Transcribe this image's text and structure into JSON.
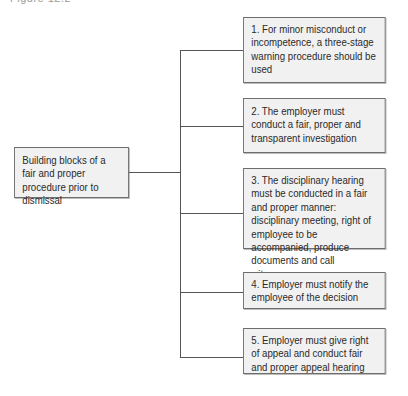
{
  "caption_fragment": "Figure 12.2",
  "root": {
    "label": "Building blocks of a fair and proper procedure prior to dismissal"
  },
  "steps": [
    {
      "label": "1. For minor misconduct or incompetence, a three-stage warning procedure should be used"
    },
    {
      "label": "2. The employer must conduct a fair, proper and transparent investigation"
    },
    {
      "label": "3. The disciplinary hearing must be conducted in a fair and proper manner: disciplinary meeting, right of employee to be accompanied, produce documents and call witnesses"
    },
    {
      "label": "4. Employer must notify the employee of the decision"
    },
    {
      "label": "5. Employer must give right of appeal and conduct fair and proper appeal hearing"
    }
  ],
  "colors": {
    "box_fill": "#f1f1f1",
    "box_border": "#6e6e6e",
    "connector": "#555555",
    "text": "#2a2a2a"
  }
}
